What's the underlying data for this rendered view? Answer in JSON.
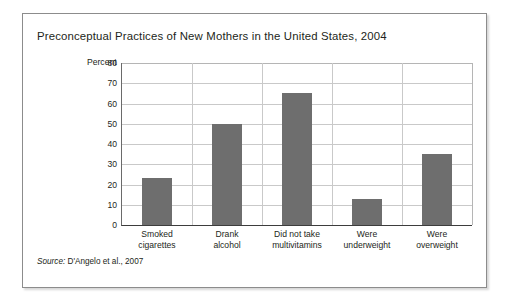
{
  "figure": {
    "title": "Preconceptual Practices of New Mothers in the United States, 2004",
    "source_word": "Source:",
    "source_text": "D'Angelo et al., 2007"
  },
  "chart_data": {
    "type": "bar",
    "title": "Preconceptual Practices of New Mothers in the United States, 2004",
    "xlabel": "",
    "ylabel": "Percent",
    "ylim": [
      0,
      80
    ],
    "yticks": [
      0,
      10,
      20,
      30,
      40,
      50,
      60,
      70,
      80
    ],
    "grid": true,
    "legend": "none",
    "categories": [
      "Smoked\ncigarettes",
      "Drank\nalcohol",
      "Did not take\nmultivitamins",
      "Were\nunderweight",
      "Were\noverweight"
    ],
    "values": [
      23,
      50,
      65,
      13,
      35
    ],
    "bar_color": "#6e6e6e"
  }
}
